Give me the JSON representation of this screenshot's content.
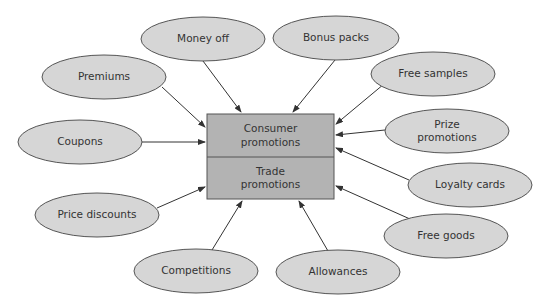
{
  "diagram": {
    "center": {
      "top_label": "Consumer\npromotions",
      "top_label_lines": [
        "Consumer",
        "promotions"
      ],
      "bottom_label_lines": [
        "Trade",
        "promotions"
      ],
      "rect": {
        "x": 207,
        "y": 114,
        "w": 127,
        "h": 85,
        "split_y": 157
      }
    },
    "nodes": [
      {
        "id": "money-off",
        "label_lines": [
          "Money off"
        ],
        "cx": 203,
        "cy": 39,
        "rx": 62,
        "ry": 22,
        "arrow": {
          "x1": 203,
          "y1": 61,
          "x2": 241,
          "y2": 112
        }
      },
      {
        "id": "bonus-packs",
        "label_lines": [
          "Bonus packs"
        ],
        "cx": 336,
        "cy": 38,
        "rx": 63,
        "ry": 22,
        "arrow": {
          "x1": 335,
          "y1": 60,
          "x2": 293,
          "y2": 112
        }
      },
      {
        "id": "premiums",
        "label_lines": [
          "Premiums"
        ],
        "cx": 104,
        "cy": 77,
        "rx": 62,
        "ry": 22,
        "arrow": {
          "x1": 162,
          "y1": 87,
          "x2": 205,
          "y2": 127
        }
      },
      {
        "id": "free-samples",
        "label_lines": [
          "Free samples"
        ],
        "cx": 433,
        "cy": 74,
        "rx": 62,
        "ry": 22,
        "arrow": {
          "x1": 384,
          "y1": 84,
          "x2": 336,
          "y2": 124
        }
      },
      {
        "id": "coupons",
        "label_lines": [
          "Coupons"
        ],
        "cx": 80,
        "cy": 142,
        "rx": 62,
        "ry": 22,
        "arrow": {
          "x1": 142,
          "y1": 142,
          "x2": 205,
          "y2": 142
        }
      },
      {
        "id": "prize-promotions",
        "label_lines": [
          "Prize",
          "promotions"
        ],
        "cx": 447,
        "cy": 131,
        "rx": 62,
        "ry": 22,
        "arrow": {
          "x1": 385,
          "y1": 130,
          "x2": 336,
          "y2": 135
        }
      },
      {
        "id": "loyalty-cards",
        "label_lines": [
          "Loyalty cards"
        ],
        "cx": 470,
        "cy": 185,
        "rx": 62,
        "ry": 22,
        "arrow": {
          "x1": 409,
          "y1": 180,
          "x2": 336,
          "y2": 148
        }
      },
      {
        "id": "price-discounts",
        "label_lines": [
          "Price discounts"
        ],
        "cx": 97,
        "cy": 215,
        "rx": 62,
        "ry": 22,
        "arrow": {
          "x1": 157,
          "y1": 208,
          "x2": 205,
          "y2": 187
        }
      },
      {
        "id": "free-goods",
        "label_lines": [
          "Free goods"
        ],
        "cx": 446,
        "cy": 236,
        "rx": 62,
        "ry": 22,
        "arrow": {
          "x1": 410,
          "y1": 219,
          "x2": 336,
          "y2": 186
        }
      },
      {
        "id": "competitions",
        "label_lines": [
          "Competitions"
        ],
        "cx": 196,
        "cy": 271,
        "rx": 62,
        "ry": 22,
        "arrow": {
          "x1": 212,
          "y1": 250,
          "x2": 242,
          "y2": 201
        }
      },
      {
        "id": "allowances",
        "label_lines": [
          "Allowances"
        ],
        "cx": 338,
        "cy": 272,
        "rx": 62,
        "ry": 22,
        "arrow": {
          "x1": 328,
          "y1": 251,
          "x2": 299,
          "y2": 201
        }
      }
    ]
  },
  "colors": {
    "ellipse_fill": "#d6d6d6",
    "box_fill": "#b3b3b3",
    "stroke": "#555555",
    "arrow": "#333333",
    "text": "#333333"
  }
}
